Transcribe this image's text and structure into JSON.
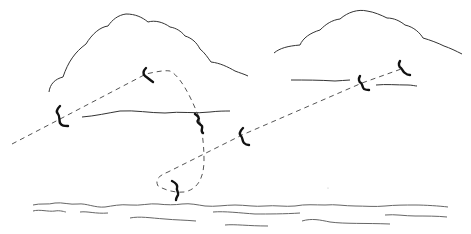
{
  "illustration": {
    "description": "Line drawing of a bird's flight path (dashed) looping between clouds above the sea",
    "colors": {
      "background": "#ffffff",
      "ink": "#222222",
      "dash": "#555555",
      "bird": "#111111",
      "water": "#666666"
    },
    "clouds": [
      {
        "name": "left-cloud"
      },
      {
        "name": "right-cloud"
      }
    ],
    "birds": [
      {
        "x": 62,
        "y": 118
      },
      {
        "x": 146,
        "y": 74
      },
      {
        "x": 201,
        "y": 122
      },
      {
        "x": 242,
        "y": 135
      },
      {
        "x": 177,
        "y": 188
      },
      {
        "x": 362,
        "y": 83
      },
      {
        "x": 404,
        "y": 68
      }
    ]
  }
}
